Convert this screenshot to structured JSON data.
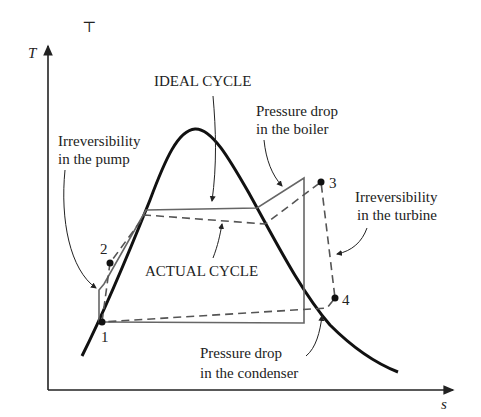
{
  "diagram": {
    "type": "T-s diagram",
    "axes": {
      "y_label": "T",
      "x_label": "s"
    },
    "top_mark": "⊤",
    "labels": {
      "ideal_cycle": "IDEAL CYCLE",
      "actual_cycle": "ACTUAL CYCLE",
      "pump_line1": "Irreversibility",
      "pump_line2": "in the pump",
      "boiler_line1": "Pressure drop",
      "boiler_line2": "in the boiler",
      "turbine_line1": "Irreversibility",
      "turbine_line2": "in the turbine",
      "condenser_line1": "Pressure drop",
      "condenser_line2": "in the condenser"
    },
    "points": [
      {
        "id": "1",
        "label": "1"
      },
      {
        "id": "2",
        "label": "2"
      },
      {
        "id": "3",
        "label": "3"
      },
      {
        "id": "4",
        "label": "4"
      }
    ],
    "colors": {
      "dome": "#111111",
      "ideal": "#666666",
      "actual": "#555555",
      "axis": "#222222"
    }
  }
}
